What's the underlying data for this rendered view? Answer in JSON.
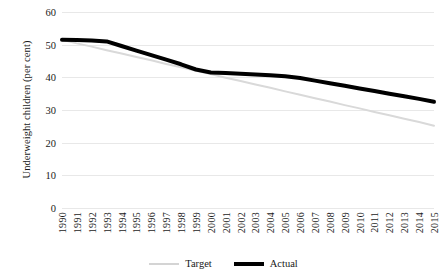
{
  "chart_data": {
    "type": "line",
    "title": "",
    "xlabel": "",
    "ylabel": "Underweight children (per cent)",
    "ylim": [
      0,
      60
    ],
    "ytick_values": [
      0,
      10,
      20,
      30,
      40,
      50,
      60
    ],
    "ytick_labels": [
      "0",
      "10",
      "20",
      "30",
      "40",
      "50",
      "60"
    ],
    "grid": true,
    "legend_position": "bottom-center",
    "categories": [
      "1990",
      "1991",
      "1992",
      "1993",
      "1994",
      "1995",
      "1996",
      "1997",
      "1998",
      "1999",
      "2000",
      "2001",
      "2002",
      "2003",
      "2004",
      "2005",
      "2006",
      "2007",
      "2008",
      "2009",
      "2010",
      "2011",
      "2012",
      "2013",
      "2014",
      "2015"
    ],
    "series": [
      {
        "name": "Target",
        "color": "#d9d9d9",
        "width": 2,
        "values": [
          51.5,
          50.4,
          49.4,
          48.3,
          47.3,
          46.2,
          45.2,
          44.1,
          43.1,
          42.0,
          41.0,
          39.9,
          38.9,
          37.8,
          36.8,
          35.7,
          34.7,
          33.6,
          32.6,
          31.5,
          30.5,
          29.4,
          28.4,
          27.3,
          26.3,
          25.2
        ]
      },
      {
        "name": "Actual",
        "color": "#000000",
        "width": 4,
        "values": [
          51.5,
          51.4,
          51.3,
          51.0,
          49.6,
          48.2,
          46.8,
          45.4,
          44.0,
          42.4,
          41.5,
          41.3,
          41.1,
          40.9,
          40.6,
          40.3,
          39.8,
          39.0,
          38.2,
          37.4,
          36.6,
          35.8,
          35.0,
          34.2,
          33.4,
          32.5
        ]
      }
    ]
  },
  "legend": {
    "target_label": "Target",
    "actual_label": "Actual"
  }
}
